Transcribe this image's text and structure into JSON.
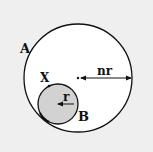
{
  "diagram": {
    "type": "geometry",
    "colors": {
      "background": "#efefef",
      "outer_fill": "#ffffff",
      "inner_fill": "#d2d2d2",
      "stroke": "#111111"
    },
    "outer_circle": {
      "label": "A",
      "cx": 78,
      "cy": 78,
      "r": 54,
      "radius_label": "nr"
    },
    "inner_circle": {
      "label": "B",
      "cx": 58,
      "cy": 104,
      "r": 20,
      "radius_label": "r"
    },
    "point": {
      "label": "X"
    }
  }
}
